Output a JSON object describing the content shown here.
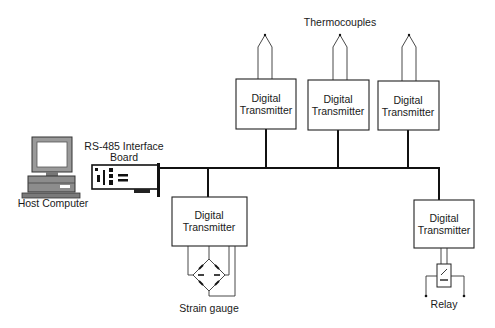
{
  "diagram": {
    "labels": {
      "host_computer": "Host Computer",
      "interface_board_line1": "RS-485 Interface",
      "interface_board_line2": "Board",
      "thermocouples": "Thermocouples",
      "strain_gauge": "Strain gauge",
      "relay": "Relay"
    },
    "transmitters": [
      {
        "line1": "Digital",
        "line2": "Transmitter"
      },
      {
        "line1": "Digital",
        "line2": "Transmitter"
      },
      {
        "line1": "Digital",
        "line2": "Transmitter"
      },
      {
        "line1": "Digital",
        "line2": "Transmitter"
      },
      {
        "line1": "Digital",
        "line2": "Transmitter"
      }
    ]
  }
}
